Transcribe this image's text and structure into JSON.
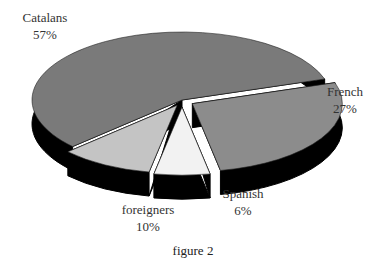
{
  "chart_data": {
    "type": "pie",
    "style": "3d-exploded",
    "title": "",
    "caption": "figure 2",
    "slices": [
      {
        "label": "Catalans",
        "value": 57,
        "display": "57%",
        "color": "#7a7a7a"
      },
      {
        "label": "French",
        "value": 27,
        "display": "27%",
        "color": "#8c8c8c"
      },
      {
        "label": "Spanish",
        "value": 6,
        "display": "6%",
        "color": "#f2f2f2"
      },
      {
        "label": "foreigners",
        "value": 10,
        "display": "10%",
        "color": "#c4c4c4"
      }
    ],
    "side_color": "#000000"
  }
}
